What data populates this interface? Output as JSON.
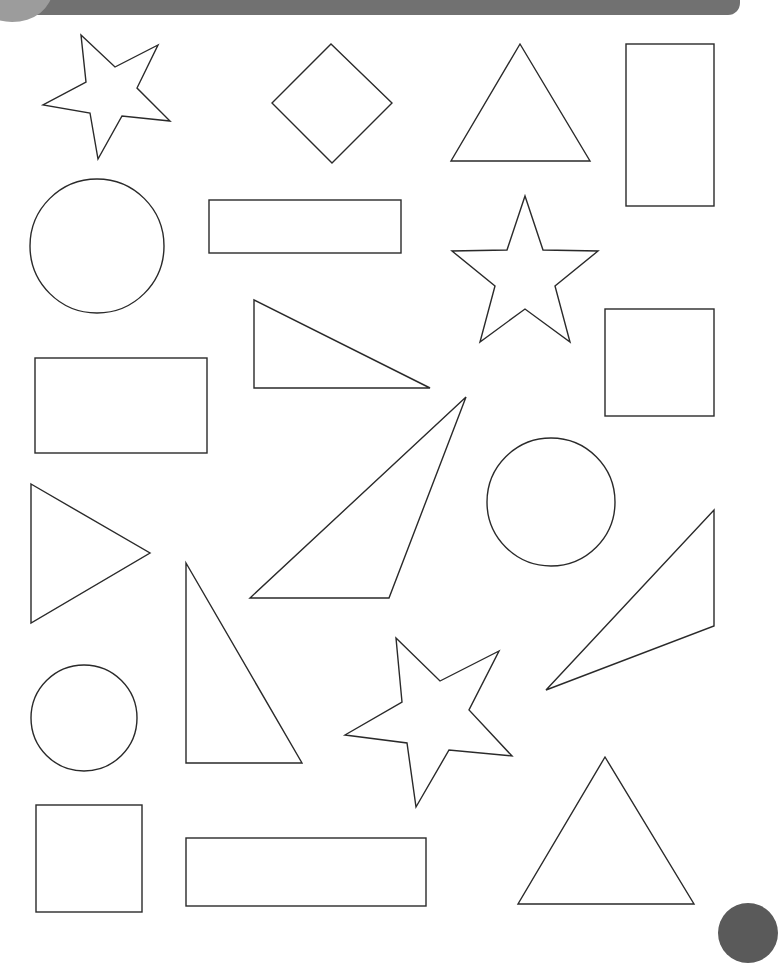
{
  "worksheet": {
    "header_banner_color": "#717171",
    "banner_circle_color": "#9c9c9c",
    "corner_dot_color": "#5a5a5a",
    "stroke_color": "#2a2a2a",
    "shapes": [
      {
        "type": "star",
        "points": "81,35 115,67 158,45 137,88 170,121 122,116 98,159 90,113 43,105 86,82"
      },
      {
        "type": "diamond",
        "points": "331,44 392,103 332,163 272,103"
      },
      {
        "type": "triangle",
        "points": "520,44 590,161 451,161"
      },
      {
        "type": "rectangle",
        "x": 626,
        "y": 44,
        "w": 88,
        "h": 162
      },
      {
        "type": "circle",
        "cx": 97,
        "cy": 246,
        "r": 67
      },
      {
        "type": "rectangle",
        "x": 209,
        "y": 200,
        "w": 192,
        "h": 53
      },
      {
        "type": "star",
        "points": "525,196 543,250 598,251 555,286 570,342 525,309 480,342 495,286 452,251 507,250"
      },
      {
        "type": "triangle",
        "points": "254,300 430,388 254,388"
      },
      {
        "type": "square",
        "x": 605,
        "y": 309,
        "w": 109,
        "h": 107
      },
      {
        "type": "rectangle",
        "x": 35,
        "y": 358,
        "w": 172,
        "h": 95
      },
      {
        "type": "triangle",
        "points": "466,397 389,598 250,598"
      },
      {
        "type": "circle",
        "cx": 551,
        "cy": 502,
        "r": 64
      },
      {
        "type": "triangle",
        "points": "31,484 150,553 31,623"
      },
      {
        "type": "triangle",
        "points": "714,510 714,626 546,690"
      },
      {
        "type": "triangle",
        "points": "186,563 302,763 186,763"
      },
      {
        "type": "circle",
        "cx": 84,
        "cy": 718,
        "r": 53
      },
      {
        "type": "star",
        "points": "396,638 440,681 499,651 469,710 512,756 449,750 416,807 407,743 345,735 402,702"
      },
      {
        "type": "triangle",
        "points": "605,757 694,904 518,904"
      },
      {
        "type": "square",
        "x": 36,
        "y": 805,
        "w": 106,
        "h": 107
      },
      {
        "type": "rectangle",
        "x": 186,
        "y": 838,
        "w": 240,
        "h": 68
      }
    ]
  }
}
